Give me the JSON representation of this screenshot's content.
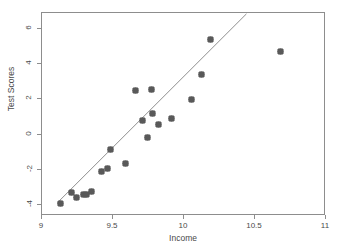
{
  "chart_data": {
    "type": "scatter",
    "title": "",
    "xlabel": "Income",
    "ylabel": "Test Scores",
    "xlim": [
      9,
      11
    ],
    "ylim": [
      -4.6,
      6.9
    ],
    "xticks": [
      9,
      9.5,
      10,
      10.5,
      11
    ],
    "xticklabels": [
      "9",
      "9.5",
      "10",
      "10.5",
      "11"
    ],
    "yticks": [
      6,
      4,
      2,
      0,
      -2,
      -4
    ],
    "yticklabels": [
      "6",
      "4",
      "2",
      "0",
      "-2",
      "-4"
    ],
    "grid": false,
    "legend": null,
    "marker_color": "#595959",
    "line_color": "#8d8d8d",
    "frame_color": "#8d8d8d",
    "points": [
      {
        "x": 9.13,
        "y": -3.9
      },
      {
        "x": 9.21,
        "y": -3.28
      },
      {
        "x": 9.24,
        "y": -3.55
      },
      {
        "x": 9.29,
        "y": -3.4
      },
      {
        "x": 9.31,
        "y": -3.4
      },
      {
        "x": 9.35,
        "y": -3.2
      },
      {
        "x": 9.42,
        "y": -2.1
      },
      {
        "x": 9.46,
        "y": -1.92
      },
      {
        "x": 9.48,
        "y": -0.82
      },
      {
        "x": 9.59,
        "y": -1.62
      },
      {
        "x": 9.66,
        "y": 2.53
      },
      {
        "x": 9.71,
        "y": 0.83
      },
      {
        "x": 9.74,
        "y": -0.18
      },
      {
        "x": 9.77,
        "y": 2.58
      },
      {
        "x": 9.78,
        "y": 1.2
      },
      {
        "x": 9.82,
        "y": 0.6
      },
      {
        "x": 9.91,
        "y": 0.9
      },
      {
        "x": 10.05,
        "y": 2.0
      },
      {
        "x": 10.12,
        "y": 3.42
      },
      {
        "x": 10.19,
        "y": 5.4
      },
      {
        "x": 10.68,
        "y": 4.7
      }
    ],
    "fit_line": {
      "label": "linear-fit",
      "x0": 9.11,
      "y0": -3.95,
      "x1": 10.45,
      "y1": 6.85
    }
  }
}
